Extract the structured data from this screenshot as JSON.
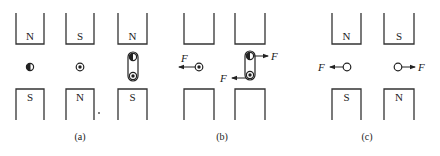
{
  "panels": [
    {
      "id": "a",
      "caption": "(a)",
      "magnets": [
        {
          "top_pole": "N",
          "bottom_pole": "S"
        },
        {
          "top_pole": "S",
          "bottom_pole": "N"
        },
        {
          "top_pole": "N",
          "bottom_pole": "S"
        }
      ],
      "conductors": [
        {
          "type": "half-filled-wire"
        },
        {
          "type": "current-out-of-page"
        },
        {
          "type": "coil",
          "top": "half-filled",
          "bottom": "current-out-of-page"
        }
      ]
    },
    {
      "id": "b",
      "caption": "(b)",
      "magnets": [
        {
          "top_pole": "",
          "bottom_pole": ""
        },
        {
          "top_pole": "",
          "bottom_pole": ""
        }
      ],
      "forces": [
        {
          "label": "F",
          "direction": "left",
          "on": "single wire"
        },
        {
          "label": "F",
          "direction": "right",
          "on": "coil top"
        },
        {
          "label": "F",
          "direction": "left",
          "on": "coil bottom"
        }
      ]
    },
    {
      "id": "c",
      "caption": "(c)",
      "magnets": [
        {
          "top_pole": "N",
          "bottom_pole": "S"
        },
        {
          "top_pole": "S",
          "bottom_pole": "N"
        }
      ],
      "forces": [
        {
          "label": "F",
          "direction": "left"
        },
        {
          "label": "F",
          "direction": "right"
        }
      ]
    }
  ],
  "force_label": "F"
}
